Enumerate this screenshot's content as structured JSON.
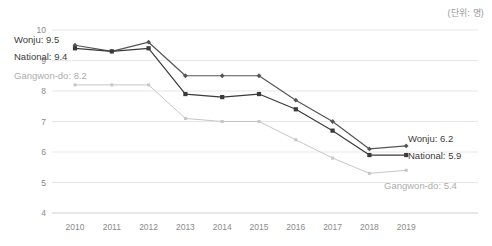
{
  "unit_note": "(단위: 명)",
  "chart_data": {
    "type": "line",
    "title": "",
    "subtitle": "",
    "xlabel": "",
    "ylabel": "",
    "unit": "(단위: 명)",
    "grid": true,
    "legend_position": "inline-endpoints",
    "x": [
      "2010",
      "2011",
      "2012",
      "2013",
      "2014",
      "2015",
      "2016",
      "2017",
      "2018",
      "2019"
    ],
    "categories": [
      "2010",
      "2011",
      "2012",
      "2013",
      "2014",
      "2015",
      "2016",
      "2017",
      "2018",
      "2019"
    ],
    "ylim": [
      4,
      10
    ],
    "yticks": [
      4,
      5,
      6,
      7,
      8,
      9,
      10
    ],
    "ytick_labels": [
      "4",
      "5",
      "6",
      "7",
      "8",
      "9",
      "10"
    ],
    "series": [
      {
        "name": "Wonju",
        "color": "#555555",
        "marker": "diamond",
        "values": [
          9.5,
          9.3,
          9.6,
          8.5,
          8.5,
          8.5,
          7.7,
          7.0,
          6.1,
          6.2
        ],
        "start_label": "Wonju: 9.5",
        "end_label": "Wonju: 6.2",
        "start_value": 9.5,
        "end_value": 6.2
      },
      {
        "name": "National",
        "color": "#3a3a3a",
        "marker": "square",
        "values": [
          9.4,
          9.3,
          9.4,
          7.9,
          7.8,
          7.9,
          7.4,
          6.7,
          5.9,
          5.9
        ],
        "start_label": "National: 9.4",
        "end_label": "National: 5.9",
        "start_value": 9.4,
        "end_value": 5.9
      },
      {
        "name": "Gangwon-do",
        "color": "#c6c6c6",
        "marker": "small-square",
        "values": [
          8.2,
          8.2,
          8.2,
          7.1,
          7.0,
          7.0,
          6.4,
          5.8,
          5.3,
          5.4
        ],
        "start_label": "Gangwon-do: 8.2",
        "end_label": "Gangwon-do: 5.4",
        "start_value": 8.2,
        "end_value": 5.4
      }
    ]
  },
  "labels": {
    "wonju_start": "Wonju: 9.5",
    "national_start": "National: 9.4",
    "gangwondo_start": "Gangwon-do: 8.2",
    "wonju_end": "Wonju: 6.2",
    "national_end": "National: 5.9",
    "gangwondo_end": "Gangwon-do: 5.4"
  }
}
